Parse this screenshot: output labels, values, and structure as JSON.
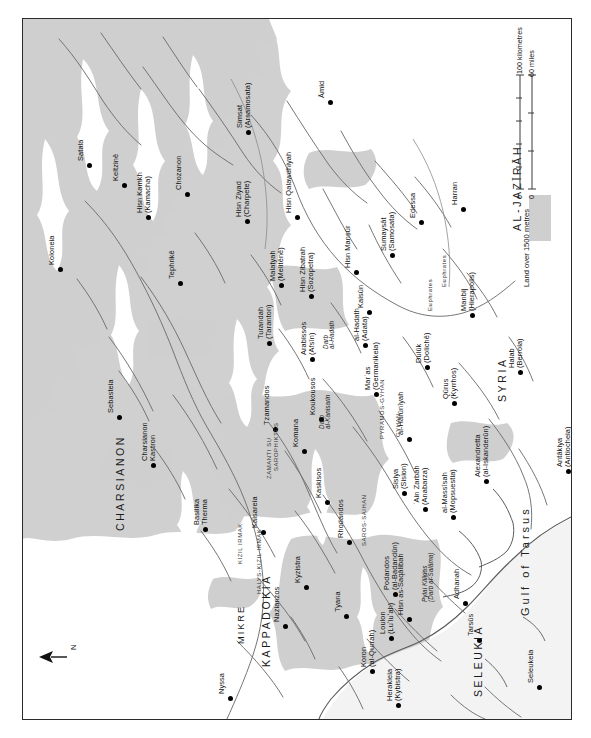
{
  "map": {
    "title": "Byzantine–Arab frontier map",
    "orientation_note": "north-arrow points left (map printed sideways)",
    "north_label": "N",
    "colors": {
      "highland": "#cfcfcf",
      "sea": "#f2f2f2",
      "coast_line": "#4a4a4a",
      "river": "#6a6a6a",
      "border": "#2b2b2b",
      "text": "#111111"
    },
    "scale": {
      "km_label": "100 kilometres",
      "mi_label": "60 miles",
      "km_zero": "0",
      "mi_zero": "0"
    },
    "legend": {
      "land_label": "Land over 1500 metres"
    },
    "regions": [
      {
        "name": "AL-JAZĪRĀH",
        "x": 489,
        "y": 212,
        "size": "lg"
      },
      {
        "name": "SYRIA",
        "x": 474,
        "y": 383,
        "size": "lg"
      },
      {
        "name": "CHARSIANON",
        "x": 92,
        "y": 512,
        "size": "lg"
      },
      {
        "name": "KAPPADOKIA",
        "x": 238,
        "y": 648,
        "size": "lg"
      },
      {
        "name": "MIKRE",
        "x": 214,
        "y": 625,
        "size": "sm"
      },
      {
        "name": "SELEUKIA",
        "x": 450,
        "y": 678,
        "size": "lg"
      }
    ],
    "water_labels": [
      {
        "name": "Gulf of Tarsus",
        "x": 497,
        "y": 597
      }
    ],
    "river_labels": [
      {
        "name": "Euphrates",
        "x": 418,
        "y": 268
      },
      {
        "name": "Euphrates",
        "x": 404,
        "y": 292
      },
      {
        "name": "HALYS-KIZIL IRMAK",
        "x": 233,
        "y": 575
      },
      {
        "name": "KIZIL IRMAK",
        "x": 214,
        "y": 545
      },
      {
        "name": "ZAMANTI SU",
        "x": 243,
        "y": 460
      },
      {
        "name": "SAROPHIKTES",
        "x": 250,
        "y": 452
      },
      {
        "name": "SAROS-SAIHAN",
        "x": 338,
        "y": 527
      },
      {
        "name": "PYRAMOS-GYHAN",
        "x": 356,
        "y": 420
      },
      {
        "name": "GYHAN",
        "x": 372,
        "y": 418
      }
    ],
    "route_labels": [
      {
        "name": "Darb\nal-Hadath",
        "x": 300,
        "y": 330
      },
      {
        "name": "Darb\nal-Kanisarin",
        "x": 296,
        "y": 410
      },
      {
        "name": "Pylai Kilikias\n(Darb al-Salāma)",
        "x": 399,
        "y": 583
      }
    ],
    "settlements": [
      {
        "name": "Satala",
        "x": 66,
        "y": 146,
        "dx": 12,
        "dy": 0
      },
      {
        "name": "Koloneia",
        "x": 37,
        "y": 250,
        "dx": 12,
        "dy": 0
      },
      {
        "name": "Keltzinē",
        "x": 101,
        "y": 166,
        "dx": 12,
        "dy": 0
      },
      {
        "name": "Hisn Kamkh\n(Kamacha)",
        "x": 125,
        "y": 198,
        "dx": 12,
        "dy": 0
      },
      {
        "name": "Chozanon",
        "x": 164,
        "y": 175,
        "dx": 12,
        "dy": 0
      },
      {
        "name": "Tephrikē",
        "x": 157,
        "y": 264,
        "dx": 12,
        "dy": 0
      },
      {
        "name": "Simsat\n(Arsamosata)",
        "x": 225,
        "y": 113,
        "dx": 12,
        "dy": 0
      },
      {
        "name": "Āmid",
        "x": 307,
        "y": 83,
        "dx": 12,
        "dy": 0
      },
      {
        "name": "Hisn Ziyad\n(Charpete)",
        "x": 224,
        "y": 202,
        "dx": 12,
        "dy": 0
      },
      {
        "name": "Hisn Qalawdhiyah",
        "x": 274,
        "y": 198,
        "dx": 12,
        "dy": 0
      },
      {
        "name": "Malaṭyah\n(Melitēnē)",
        "x": 258,
        "y": 266,
        "dx": 12,
        "dy": 0
      },
      {
        "name": "Hisn Zibatrah\n(Sozopetra)",
        "x": 288,
        "y": 277,
        "dx": 12,
        "dy": 0
      },
      {
        "name": "Hisn Manṣūr",
        "x": 333,
        "y": 253,
        "dx": 12,
        "dy": 0
      },
      {
        "name": "Sumaysāt\n(Samosata)",
        "x": 369,
        "y": 236,
        "dx": 12,
        "dy": 0
      },
      {
        "name": "Edessa",
        "x": 398,
        "y": 203,
        "dx": 12,
        "dy": 0
      },
      {
        "name": "Harran",
        "x": 440,
        "y": 190,
        "dx": 12,
        "dy": 0
      },
      {
        "name": "Kaisūn",
        "x": 346,
        "y": 293,
        "dx": 12,
        "dy": 0
      },
      {
        "name": "Manbij\n(Hierapolis)",
        "x": 449,
        "y": 296,
        "dx": 12,
        "dy": 0
      },
      {
        "name": "Turandah\n(Taranton)",
        "x": 246,
        "y": 324,
        "dx": 12,
        "dy": 0
      },
      {
        "name": "Arabissos\n(Afsīn)",
        "x": 289,
        "y": 340,
        "dx": 12,
        "dy": 0
      },
      {
        "name": "al-Hadath\n(Adata)",
        "x": 342,
        "y": 326,
        "dx": 12,
        "dy": 0
      },
      {
        "name": "Marʿas\n(Germanikeia)",
        "x": 353,
        "y": 375,
        "dx": 12,
        "dy": 0
      },
      {
        "name": "Dulūk\n(Dolichē)",
        "x": 404,
        "y": 348,
        "dx": 12,
        "dy": 0
      },
      {
        "name": "Qūrus\n(Kyrrhos)",
        "x": 431,
        "y": 384,
        "dx": 12,
        "dy": 0
      },
      {
        "name": "Koukousos",
        "x": 298,
        "y": 400,
        "dx": 12,
        "dy": 0
      },
      {
        "name": "Komana",
        "x": 281,
        "y": 432,
        "dx": 12,
        "dy": 0
      },
      {
        "name": "Tzamandos",
        "x": 252,
        "y": 410,
        "dx": 12,
        "dy": 0
      },
      {
        "name": "al-Hārūnīyah",
        "x": 386,
        "y": 420,
        "dx": 12,
        "dy": 0
      },
      {
        "name": "Sebasteia",
        "x": 96,
        "y": 398,
        "dx": 12,
        "dy": 0
      },
      {
        "name": "Charsianon\nKastron",
        "x": 130,
        "y": 446,
        "dx": 12,
        "dy": 0
      },
      {
        "name": "Basilika\nTherma",
        "x": 182,
        "y": 510,
        "dx": 12,
        "dy": 0
      },
      {
        "name": "Kaisareia",
        "x": 240,
        "y": 513,
        "dx": 12,
        "dy": 0
      },
      {
        "name": "Kaskisos",
        "x": 304,
        "y": 483,
        "dx": 12,
        "dy": 0
      },
      {
        "name": "Rhodandos",
        "x": 326,
        "y": 523,
        "dx": 12,
        "dy": 0
      },
      {
        "name": "Sisiya\n(Sision)",
        "x": 381,
        "y": 474,
        "dx": 12,
        "dy": 0
      },
      {
        "name": "ʿAin Zarbah\n(Anabarza)",
        "x": 402,
        "y": 490,
        "dx": 12,
        "dy": 0
      },
      {
        "name": "al-Massīsah\n(Mopsuestia)",
        "x": 430,
        "y": 498,
        "dx": 12,
        "dy": 0
      },
      {
        "name": "Alexandretta\n(al-Iskanderūn)",
        "x": 463,
        "y": 462,
        "dx": 12,
        "dy": 0
      },
      {
        "name": "Antākiya\n(Antiocheia)",
        "x": 545,
        "y": 452,
        "dx": 12,
        "dy": 0
      },
      {
        "name": "Halab\n(Berroia)",
        "x": 497,
        "y": 353,
        "dx": 12,
        "dy": 0
      },
      {
        "name": "Kyzistra",
        "x": 283,
        "y": 568,
        "dx": 12,
        "dy": 0
      },
      {
        "name": "Nazianzos",
        "x": 262,
        "y": 607,
        "dx": 12,
        "dy": 0
      },
      {
        "name": "Nyssa",
        "x": 207,
        "y": 679,
        "dx": 12,
        "dy": 0
      },
      {
        "name": "Tyana",
        "x": 323,
        "y": 597,
        "dx": 12,
        "dy": 0
      },
      {
        "name": "Loulon\n(Luʻluʻah)",
        "x": 368,
        "y": 619,
        "dx": 12,
        "dy": 0
      },
      {
        "name": "Podandos\n(al-Badandūn)",
        "x": 372,
        "y": 575,
        "dx": 12,
        "dy": 0
      },
      {
        "name": "Hisn as-Saqālibah",
        "x": 386,
        "y": 600,
        "dx": 12,
        "dy": 0
      },
      {
        "name": "Koron\n(al-Qurrah)",
        "x": 349,
        "y": 652,
        "dx": 12,
        "dy": 0
      },
      {
        "name": "Herakleia\n(Kybistra)",
        "x": 375,
        "y": 686,
        "dx": 12,
        "dy": 0
      },
      {
        "name": "Adhanah",
        "x": 442,
        "y": 584,
        "dx": 12,
        "dy": 0
      },
      {
        "name": "Tarsūs",
        "x": 456,
        "y": 621,
        "dx": 12,
        "dy": 0
      },
      {
        "name": "Seleukeia",
        "x": 516,
        "y": 668,
        "dx": 12,
        "dy": 0
      }
    ]
  }
}
